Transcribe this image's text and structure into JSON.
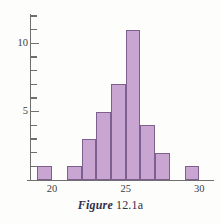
{
  "figure": {
    "caption_word": "Figure",
    "caption_number": "12.1a"
  },
  "colors": {
    "bar_fill": "#c9a6d2",
    "bar_stroke": "#7d6090",
    "axis": "#6f6f6f",
    "text": "#3d3d3d",
    "caption": "#2f2f4f",
    "background": "#fdfdfb"
  },
  "chart_data": {
    "type": "bar",
    "title": "",
    "subtitle": "",
    "xlabel": "",
    "ylabel": "",
    "grid": false,
    "legend": null,
    "xlim": [
      18.5,
      31
    ],
    "ylim": [
      0,
      12
    ],
    "x_tick_labels": [
      "20",
      "25",
      "30"
    ],
    "x_tick_values": [
      20,
      25,
      30
    ],
    "y_tick_labels": [
      "5",
      "10"
    ],
    "y_tick_values": [
      5,
      10
    ],
    "y_minor_ticks": [
      1,
      2,
      3,
      4,
      6,
      7,
      8,
      9,
      11,
      12
    ],
    "bin_width": 1,
    "categories": [
      "19-20",
      "21-22",
      "22-23",
      "23-24",
      "24-25",
      "25-26",
      "26-27",
      "27-28",
      "29-30"
    ],
    "bin_starts": [
      19,
      21,
      22,
      23,
      24,
      25,
      26,
      27,
      29
    ],
    "values": [
      1,
      1,
      3,
      5,
      7,
      11,
      4,
      2,
      1
    ]
  }
}
